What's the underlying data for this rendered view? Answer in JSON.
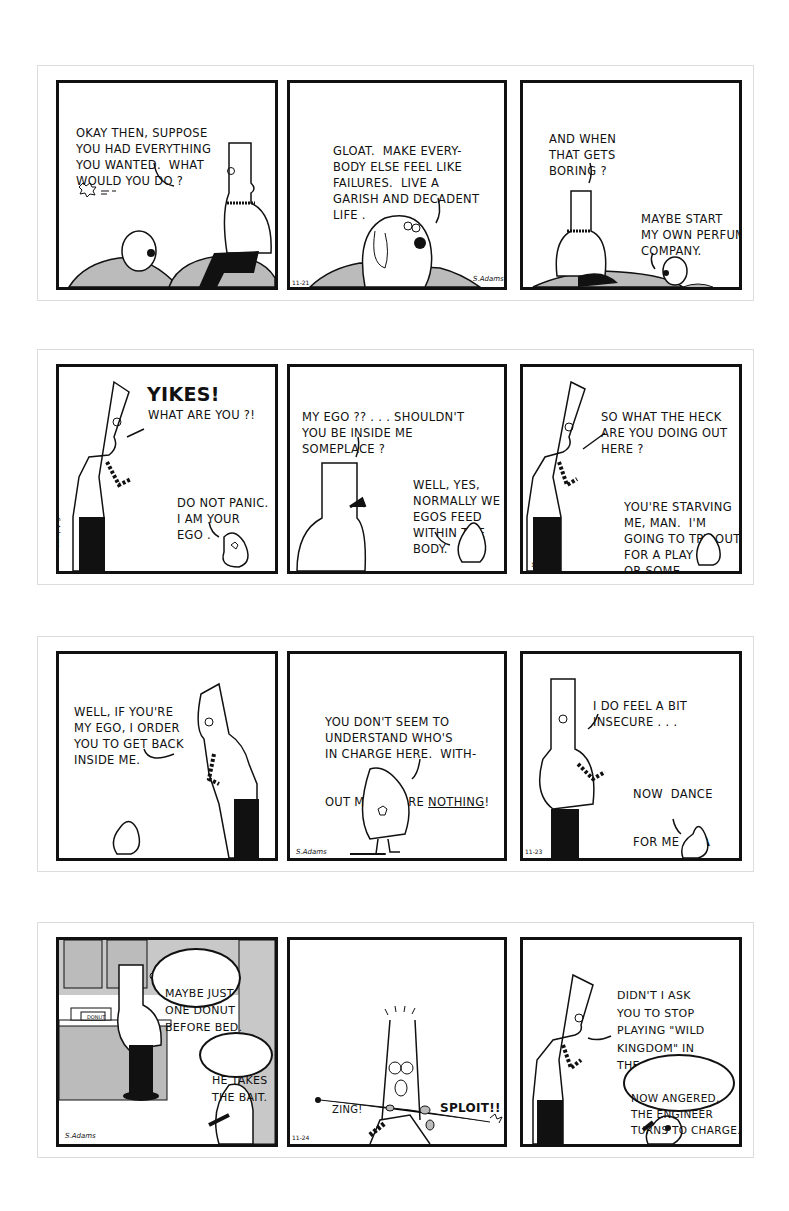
{
  "strips": [
    {
      "id": "strip-1",
      "date": "11-21",
      "signature": "S.Adams",
      "panels": [
        {
          "lines": [
            "OKAY THEN, SUPPOSE",
            "YOU HAD EVERYTHING",
            "YOU WANTED.  WHAT",
            "WOULD YOU DO ?"
          ],
          "speaker": "Dilbert"
        },
        {
          "lines": [
            "GLOAT.  MAKE EVERY-",
            "BODY ELSE FEEL LIKE",
            "FAILURES.  LIVE A",
            "GARISH AND DECADENT",
            "LIFE ."
          ],
          "speaker": "Dogbert"
        },
        {
          "dilbert_lines": [
            "AND WHEN",
            "THAT GETS",
            "BORING ?"
          ],
          "dogbert_lines": [
            "MAYBE START",
            "MY OWN PERFUME",
            "COMPANY."
          ]
        }
      ]
    },
    {
      "id": "strip-2",
      "date": "11-22",
      "signature": "S.Adams",
      "panels": [
        {
          "exclaim": "YIKES!",
          "lines": [
            "WHAT ARE YOU ?!"
          ],
          "ego_lines": [
            "DO NOT PANIC.",
            "I AM YOUR",
            "EGO ."
          ]
        },
        {
          "lines": [
            "MY EGO ?? . . . SHOULDN'T",
            "YOU BE INSIDE ME",
            "SOMEPLACE ?"
          ],
          "ego_lines": [
            "WELL, YES,",
            "NORMALLY WE",
            "EGOS FEED",
            "WITHIN THE",
            "BODY."
          ]
        },
        {
          "lines": [
            "SO WHAT THE HECK",
            "ARE YOU DOING OUT",
            "HERE ?"
          ],
          "ego_lines": [
            "YOU'RE STARVING",
            "ME, MAN.  I'M",
            "GOING TO TRY OUT",
            "FOR A PLAY",
            "OR SOME-",
            "THING."
          ]
        }
      ]
    },
    {
      "id": "strip-3",
      "date": "11-23",
      "signature": "S.Adams",
      "panels": [
        {
          "lines": [
            "WELL, IF YOU'RE",
            "MY EGO, I ORDER",
            "YOU TO GET BACK",
            "INSIDE ME."
          ]
        },
        {
          "lines": [
            "YOU DON'T SEEM TO",
            "UNDERSTAND WHO'S",
            "IN CHARGE HERE.  WITH-"
          ],
          "last_line_prefix": "OUT ME, YOU'RE ",
          "last_line_emph": "NOTHING",
          "last_line_suffix": "!"
        },
        {
          "lines": [
            "I DO FEEL A BIT",
            "INSECURE . . ."
          ],
          "ego_line1_prefix": "NOW  DANCE",
          "ego_line2_prefix": "FOR ME , ",
          "ego_line2_bold": "HA",
          "ego_line3_bold": "HA HA",
          "ego_line3_suffix": ", DANCE!"
        }
      ]
    },
    {
      "id": "strip-4",
      "date": "11-24",
      "signature": "S.Adams",
      "panels": [
        {
          "thought_dilbert": [
            "MAYBE JUST",
            "ONE DONUT",
            "BEFORE BED."
          ],
          "thought_dogbert": [
            "HE TAKES",
            "THE BAIT."
          ],
          "box_label": "DONUT"
        },
        {
          "sfx_left": "ZING!",
          "sfx_right": "SPLOIT!!"
        },
        {
          "lines": [
            "DIDN'T I ASK",
            "YOU TO STOP",
            "PLAYING \"WILD",
            "KINGDOM\" IN",
            "THE HOUSE ?"
          ],
          "thought_dogbert": [
            "NOW ANGERED,",
            "THE ENGINEER",
            "TURNS TO CHARGE."
          ]
        }
      ]
    }
  ]
}
